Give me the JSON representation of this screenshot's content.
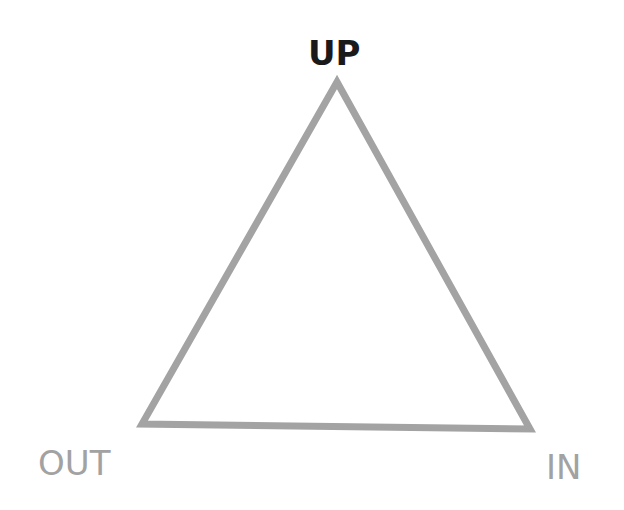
{
  "diagram": {
    "type": "triangle",
    "stroke_color": "#a3a3a3",
    "stroke_width": 7,
    "vertices": {
      "top": [
        337,
        82
      ],
      "bottom_left": [
        142,
        424
      ],
      "bottom_right": [
        530,
        429
      ]
    },
    "labels": {
      "top": "UP",
      "bottom_left": "OUT",
      "bottom_right": "IN"
    },
    "colors": {
      "top_label": "#1a1a1a",
      "side_labels": "#a2a2a2"
    }
  }
}
